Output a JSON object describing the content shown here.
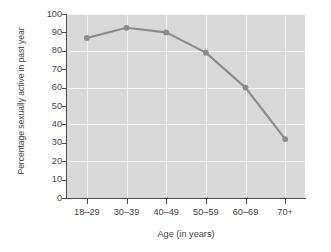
{
  "chart_data": {
    "type": "line",
    "title": "",
    "xlabel": "Age (in years)",
    "ylabel": "Percentage sexually active in past year",
    "categories": [
      "18–29",
      "30–39",
      "40–49",
      "50–59",
      "60–69",
      "70+"
    ],
    "values": [
      87,
      92.5,
      90,
      79,
      60,
      32
    ],
    "series": [
      {
        "name": "Percentage sexually active in past year",
        "values": [
          87,
          92.5,
          90,
          79,
          60,
          32
        ]
      }
    ],
    "ylim": [
      0,
      100
    ],
    "ytick_labels": [
      "0",
      "10",
      "20",
      "30",
      "40",
      "50",
      "60",
      "70",
      "80",
      "90",
      "100"
    ],
    "ytick_values": [
      0,
      10,
      20,
      30,
      40,
      50,
      60,
      70,
      80,
      90,
      100
    ],
    "gridlines": {
      "horizontal": [
        20,
        40,
        60,
        80,
        100
      ],
      "vertical_at_categories": true,
      "color": "#f3f3f3"
    },
    "legend": null,
    "legend_position": "none",
    "marker": "circle",
    "colors": {
      "line": "#8a8a8a",
      "marker": "#8a8a8a",
      "plot_background": "#d9d9d9",
      "figure_background": "#ffffff",
      "axis": "#4a4a4a",
      "text": "#3f3f3f"
    }
  }
}
